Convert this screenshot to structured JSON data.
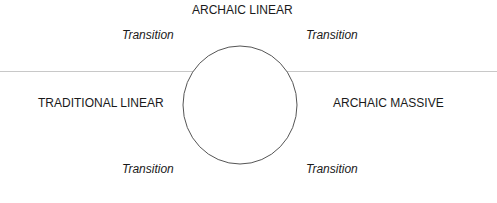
{
  "diagram": {
    "labels": {
      "top": "ARCHAIC LINEAR",
      "left": "TRADITIONAL LINEAR",
      "right": "ARCHAIC MASSIVE",
      "upper_left": "Transition",
      "upper_right": "Transition",
      "lower_left": "Transition",
      "lower_right": "Transition"
    },
    "colors": {
      "circle_stroke": "#555555",
      "line_stroke": "#c8c8c8",
      "text": "#1a1a1a"
    }
  }
}
